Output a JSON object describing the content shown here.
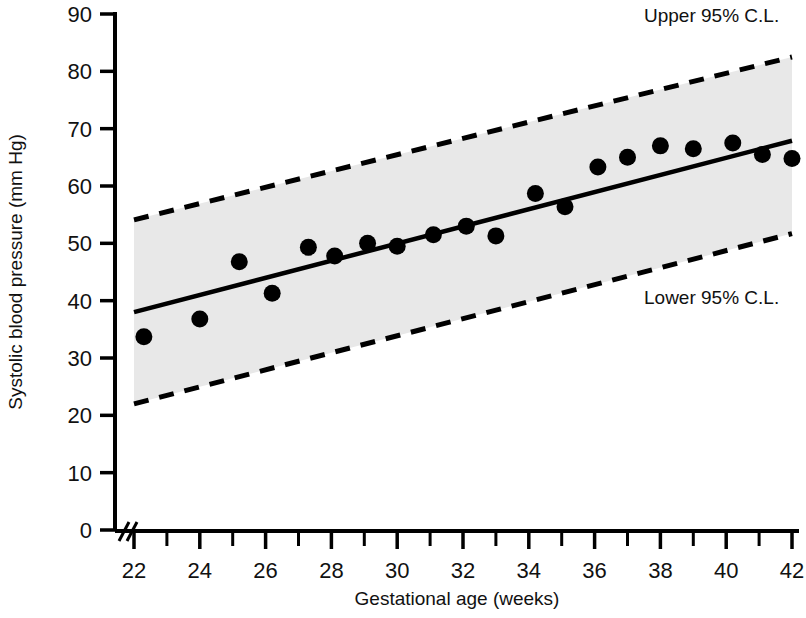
{
  "chart_data": {
    "type": "scatter",
    "title": "",
    "xlabel": "Gestational age (weeks)",
    "ylabel": "Systolic blood pressure (mm Hg)",
    "xlim": [
      22,
      42
    ],
    "ylim": [
      0,
      90
    ],
    "y_axis_break": true,
    "grid": false,
    "legend_position": "inline-annotations",
    "x_ticks_major": [
      22,
      24,
      26,
      28,
      30,
      32,
      34,
      36,
      38,
      40,
      42
    ],
    "x_ticks_minor": [
      23,
      25,
      27,
      29,
      31,
      33,
      35,
      37,
      39,
      41
    ],
    "y_ticks": [
      0,
      10,
      20,
      30,
      40,
      50,
      60,
      70,
      80,
      90
    ],
    "x": [
      22.3,
      24.0,
      25.2,
      26.2,
      27.3,
      28.1,
      29.1,
      30.0,
      31.1,
      32.1,
      33.0,
      34.2,
      35.1,
      36.1,
      37.0,
      38.0,
      39.0,
      40.2,
      41.1,
      42.0
    ],
    "values": [
      33.7,
      36.8,
      46.8,
      41.3,
      49.3,
      47.8,
      50.0,
      49.5,
      51.5,
      53.0,
      51.3,
      58.7,
      56.4,
      63.3,
      65.0,
      67.0,
      66.5,
      67.5,
      65.5,
      64.8
    ],
    "series": [
      {
        "name": "Observations",
        "type": "scatter",
        "marker": "filled-circle",
        "color": "#000000",
        "x": [
          22.3,
          24.0,
          25.2,
          26.2,
          27.3,
          28.1,
          29.1,
          30.0,
          31.1,
          32.1,
          33.0,
          34.2,
          35.1,
          36.1,
          37.0,
          38.0,
          39.0,
          40.2,
          41.1,
          42.0
        ],
        "values": [
          33.7,
          36.8,
          46.8,
          41.3,
          49.3,
          47.8,
          50.0,
          49.5,
          51.5,
          53.0,
          51.3,
          58.7,
          56.4,
          63.3,
          65.0,
          67.0,
          66.5,
          67.5,
          65.5,
          64.8
        ]
      },
      {
        "name": "Regression line",
        "type": "line",
        "style": "solid",
        "color": "#000000",
        "x": [
          22,
          42
        ],
        "values": [
          38.0,
          67.9
        ]
      },
      {
        "name": "Upper 95% C.L.",
        "type": "line",
        "style": "dashed",
        "color": "#000000",
        "x": [
          22,
          42
        ],
        "values": [
          54.1,
          82.5
        ]
      },
      {
        "name": "Lower 95% C.L.",
        "type": "line",
        "style": "dashed",
        "color": "#000000",
        "x": [
          22,
          42
        ],
        "values": [
          22.0,
          51.7
        ]
      }
    ],
    "band": {
      "name": "95% confidence band",
      "fill_color": "#e8e8e8",
      "upper_x": [
        22,
        42
      ],
      "upper_values": [
        54.1,
        82.5
      ],
      "lower_x": [
        22,
        42
      ],
      "lower_values": [
        22.0,
        51.7
      ]
    },
    "annotations": [
      {
        "text": "Upper 95% C.L.",
        "x": 38.6,
        "y": 87.0
      },
      {
        "text": "Lower 95% C.L.",
        "x": 38.6,
        "y": 38.6
      }
    ]
  },
  "axes": {
    "x_label": "Gestational age (weeks)",
    "y_label": "Systolic blood pressure (mm Hg)",
    "x_tick_labels": [
      "22",
      "24",
      "26",
      "28",
      "30",
      "32",
      "34",
      "36",
      "38",
      "40",
      "42"
    ],
    "y_tick_labels": [
      "90",
      "80",
      "70",
      "60",
      "50",
      "40",
      "30",
      "20",
      "10",
      "0"
    ]
  },
  "annotations": {
    "upper_cl": "Upper 95% C.L.",
    "lower_cl": "Lower 95% C.L."
  },
  "colors": {
    "ink": "#000000",
    "band_fill": "#e8e8e8",
    "background": "#ffffff"
  }
}
